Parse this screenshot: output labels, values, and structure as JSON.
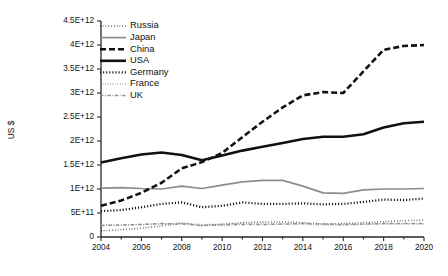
{
  "chart_data": {
    "type": "line",
    "title": "",
    "xlabel": "",
    "ylabel": "US $",
    "xlim": [
      2004,
      2020
    ],
    "ylim": [
      0,
      4500000000000
    ],
    "grid": false,
    "legend_position": "top-left-inside",
    "x": [
      2004,
      2005,
      2006,
      2007,
      2008,
      2009,
      2010,
      2011,
      2012,
      2013,
      2014,
      2015,
      2016,
      2017,
      2018,
      2019,
      2020
    ],
    "xtick_labels": [
      "2004",
      "2006",
      "2008",
      "2010",
      "2012",
      "2014",
      "2016",
      "2018",
      "2020"
    ],
    "xtick_values": [
      2004,
      2006,
      2008,
      2010,
      2012,
      2014,
      2016,
      2018,
      2020
    ],
    "xminor_values": [
      2005,
      2007,
      2009,
      2011,
      2013,
      2015,
      2017,
      2019
    ],
    "ytick_labels": [
      "0",
      "5E+11",
      "1E+12",
      "1.5E+12",
      "2E+12",
      "2.5E+12",
      "3E+12",
      "3.5E+12",
      "4E+12",
      "4.5E+12"
    ],
    "ytick_values": [
      0,
      500000000000,
      1000000000000,
      1500000000000,
      2000000000000,
      2500000000000,
      3000000000000,
      3500000000000,
      4000000000000,
      4500000000000
    ],
    "series": [
      {
        "name": "Russia",
        "style": "fine-dotted",
        "color": "#1a1a1a",
        "width": 1.5,
        "dash": "0.6 2.2",
        "values": [
          130000000000,
          150000000000,
          185000000000,
          230000000000,
          290000000000,
          240000000000,
          265000000000,
          300000000000,
          310000000000,
          315000000000,
          300000000000,
          270000000000,
          280000000000,
          300000000000,
          320000000000,
          340000000000,
          350000000000
        ]
      },
      {
        "name": "Japan",
        "style": "solid",
        "color": "#8c8c8c",
        "width": 1.7,
        "dash": "",
        "values": [
          1020000000000,
          1030000000000,
          1010000000000,
          1000000000000,
          1060000000000,
          1010000000000,
          1080000000000,
          1150000000000,
          1180000000000,
          1180000000000,
          1060000000000,
          920000000000,
          910000000000,
          980000000000,
          1000000000000,
          1000000000000,
          1010000000000
        ]
      },
      {
        "name": "China",
        "style": "dashed-thick",
        "color": "#111111",
        "width": 2.6,
        "dash": "6 3",
        "values": [
          650000000000,
          760000000000,
          920000000000,
          1130000000000,
          1430000000000,
          1560000000000,
          1750000000000,
          2080000000000,
          2400000000000,
          2700000000000,
          2950000000000,
          3020000000000,
          3000000000000,
          3450000000000,
          3900000000000,
          3980000000000,
          4000000000000
        ]
      },
      {
        "name": "USA",
        "style": "solid-thick",
        "color": "#111111",
        "width": 2.6,
        "dash": "",
        "values": [
          1550000000000,
          1640000000000,
          1720000000000,
          1760000000000,
          1710000000000,
          1600000000000,
          1700000000000,
          1800000000000,
          1880000000000,
          1960000000000,
          2040000000000,
          2090000000000,
          2090000000000,
          2140000000000,
          2280000000000,
          2370000000000,
          2400000000000
        ]
      },
      {
        "name": "Germany",
        "style": "bold-dotted",
        "color": "#111111",
        "width": 2.3,
        "dash": "1.1 2.0",
        "values": [
          540000000000,
          560000000000,
          620000000000,
          690000000000,
          720000000000,
          620000000000,
          650000000000,
          720000000000,
          690000000000,
          690000000000,
          700000000000,
          680000000000,
          690000000000,
          730000000000,
          780000000000,
          770000000000,
          800000000000
        ]
      },
      {
        "name": "France",
        "style": "light-dotted",
        "color": "#9a9a9a",
        "width": 1.4,
        "dash": "0.7 1.8",
        "values": [
          250000000000,
          250000000000,
          260000000000,
          270000000000,
          290000000000,
          260000000000,
          270000000000,
          280000000000,
          270000000000,
          270000000000,
          270000000000,
          250000000000,
          250000000000,
          260000000000,
          270000000000,
          270000000000,
          270000000000
        ]
      },
      {
        "name": "UK",
        "style": "gray-dash-dot",
        "color": "#8f8f8f",
        "width": 1.5,
        "dash": "3.4 1.6 0.8 1.6",
        "values": [
          240000000000,
          250000000000,
          260000000000,
          280000000000,
          270000000000,
          240000000000,
          250000000000,
          260000000000,
          260000000000,
          270000000000,
          280000000000,
          270000000000,
          260000000000,
          270000000000,
          280000000000,
          280000000000,
          280000000000
        ]
      }
    ]
  },
  "legend": {
    "entries": [
      {
        "label": "Russia"
      },
      {
        "label": "Japan"
      },
      {
        "label": "China"
      },
      {
        "label": "USA"
      },
      {
        "label": "Germany"
      },
      {
        "label": "France"
      },
      {
        "label": "UK"
      }
    ]
  }
}
